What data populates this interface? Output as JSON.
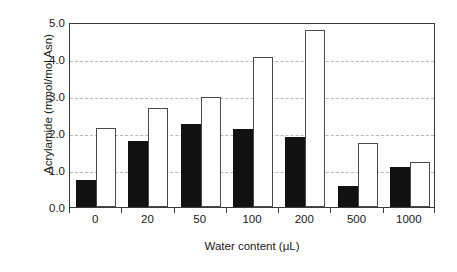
{
  "chart_data": {
    "type": "bar",
    "title": "",
    "xlabel": "Water content (μL)",
    "ylabel": "Acrylamide (mmol/mol Asn)",
    "categories": [
      "0",
      "20",
      "50",
      "100",
      "200",
      "500",
      "1000"
    ],
    "series": [
      {
        "name": "series-dark",
        "fill": "#111111",
        "values": [
          0.73,
          1.78,
          2.25,
          2.1,
          1.9,
          0.58,
          1.08
        ]
      },
      {
        "name": "series-light",
        "fill": "#ffffff",
        "values": [
          2.14,
          2.68,
          2.98,
          4.05,
          4.78,
          1.74,
          1.22
        ]
      }
    ],
    "ylim": [
      0.0,
      5.0
    ],
    "ytick_values": [
      0.0,
      1.0,
      2.0,
      3.0,
      4.0,
      5.0
    ],
    "ytick_labels": [
      "0.0",
      "1.0",
      "2.0",
      "3.0",
      "4.0",
      "5.0"
    ],
    "grid": true,
    "grid_axis": "y",
    "grid_style": "dashed",
    "grid_color": "#b9b9b9",
    "legend": "none",
    "axis_color": "#3a3a3a",
    "background": "#ffffff"
  }
}
